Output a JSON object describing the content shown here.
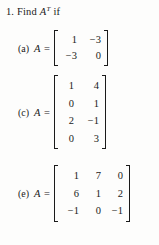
{
  "problem": {
    "number": "1.",
    "stem": "Find",
    "matrix_symbol": "A",
    "superscript": "T",
    "conditional": "if"
  },
  "parts": [
    {
      "label": "(a)",
      "symbol": "A",
      "equals": "=",
      "rows": 2,
      "cols": 2,
      "cells": [
        "1",
        "−3",
        "−3",
        "0"
      ]
    },
    {
      "label": "(c)",
      "symbol": "A",
      "equals": "=",
      "rows": 4,
      "cols": 2,
      "cells": [
        "1",
        "4",
        "0",
        "1",
        "2",
        "−1",
        "0",
        "3"
      ]
    },
    {
      "label": "(e)",
      "symbol": "A",
      "equals": "=",
      "rows": 3,
      "cols": 3,
      "cells": [
        "1",
        "7",
        "0",
        "6",
        "1",
        "2",
        "−1",
        "0",
        "−1"
      ]
    }
  ],
  "colors": {
    "page_background": "#fdfdfc",
    "ink": "#1a1a1a"
  }
}
